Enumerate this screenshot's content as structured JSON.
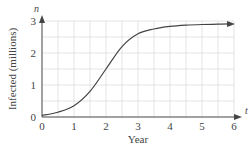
{
  "chart_data": {
    "type": "line",
    "title": "",
    "xlabel": "Year",
    "ylabel": "Infected (millions)",
    "x_var": "t",
    "y_var": "n",
    "xlim": [
      0,
      6
    ],
    "ylim": [
      0,
      3
    ],
    "x_ticks": [
      "0",
      "1",
      "2",
      "3",
      "4",
      "5",
      "6"
    ],
    "y_ticks": [
      "0",
      "1",
      "2",
      "3"
    ],
    "grid": true,
    "legend": null,
    "series": [
      {
        "name": "n(t)",
        "x": [
          0,
          0.5,
          1,
          1.5,
          2,
          2.5,
          3,
          3.5,
          4,
          4.5,
          5,
          5.5,
          6
        ],
        "values": [
          0.05,
          0.15,
          0.35,
          0.8,
          1.5,
          2.2,
          2.6,
          2.75,
          2.83,
          2.87,
          2.89,
          2.9,
          2.91
        ]
      }
    ],
    "colors": {
      "curve": "#444444",
      "grid": "#dddddd",
      "axis": "#444444"
    }
  }
}
